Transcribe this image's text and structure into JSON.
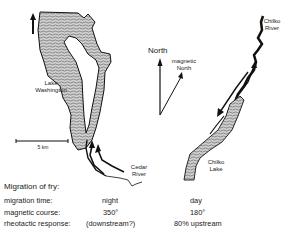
{
  "figure": {
    "left_map": {
      "lake_label": [
        "Lake",
        "Washington"
      ],
      "river_label": [
        "Cedar",
        "River"
      ],
      "scale_label": "5 km"
    },
    "compass": {
      "north_label": "North",
      "magnetic_label": [
        "magnetic",
        "North"
      ]
    },
    "right_map": {
      "river_label": [
        "Chilko",
        "River"
      ],
      "lake_label": [
        "Chilko",
        "Lake"
      ]
    },
    "caption": "Migration of fry:",
    "table": {
      "rows": [
        {
          "label": "migration time:",
          "left": "night",
          "right": "day"
        },
        {
          "label": "magnetic course:",
          "left": "350°",
          "right": "180°"
        },
        {
          "label": "rheotactic response:",
          "left": "(downstream?)",
          "right": "80% upstream"
        }
      ]
    },
    "colors": {
      "ink": "#111111",
      "water_fill": "#bdbdbd",
      "background": "#ffffff"
    }
  }
}
